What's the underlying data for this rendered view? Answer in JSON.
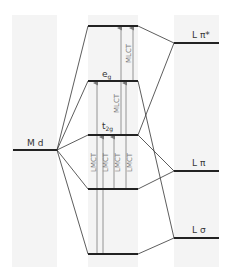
{
  "diagram": {
    "colors": {
      "background": "#ffffff",
      "column_shade": "#f4f4f4",
      "level_line": "#222222",
      "connector_line": "#333333",
      "arrow": "#888888",
      "text": "#333333"
    },
    "left_column": {
      "label": "M d",
      "level": {
        "name": "metal-d",
        "x1": 13,
        "x2": 57,
        "y": 150
      }
    },
    "right_column": {
      "levels": [
        {
          "name": "ligand-pi-star",
          "label": "L π*",
          "x1": 174,
          "x2": 219,
          "y": 43
        },
        {
          "name": "ligand-pi",
          "label": "L π",
          "x1": 174,
          "x2": 219,
          "y": 171
        },
        {
          "name": "ligand-sigma",
          "label": "L σ",
          "x1": 174,
          "x2": 219,
          "y": 238
        }
      ]
    },
    "center_column": {
      "levels": [
        {
          "name": "pi-star-complex",
          "label": "",
          "x1": 88,
          "x2": 138,
          "y": 26
        },
        {
          "name": "eg",
          "label": "e",
          "sub": "g",
          "x1": 88,
          "x2": 138,
          "y": 81
        },
        {
          "name": "t2g",
          "label": "t",
          "sub": "2g",
          "x1": 88,
          "x2": 138,
          "y": 135
        },
        {
          "name": "pi-bonding",
          "label": "",
          "x1": 88,
          "x2": 138,
          "y": 189
        },
        {
          "name": "sigma-bonding",
          "label": "",
          "x1": 88,
          "x2": 138,
          "y": 254
        }
      ]
    },
    "transitions": {
      "lmct_label": "LMCT",
      "mlct_label": "MLCT",
      "lmct_labels": [
        "LMCT",
        "LMCT",
        "LMCT",
        "LMCT"
      ],
      "mlct_labels": [
        "MLCT",
        "MLCT"
      ]
    }
  }
}
